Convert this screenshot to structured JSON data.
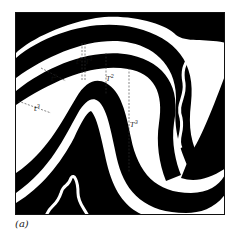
{
  "figure": {
    "caption": "(a)",
    "labels": {
      "t1": "t",
      "t1_sup": "1",
      "T1": "T",
      "T1_sup": "1",
      "t2": "t",
      "t2_sup": "2",
      "T2": "T",
      "T2_sup": "2",
      "t3": "t",
      "t3_sup": "3",
      "T3": "T",
      "T3_sup": "3"
    },
    "colors": {
      "layer": "#000000",
      "background": "#ffffff"
    }
  }
}
